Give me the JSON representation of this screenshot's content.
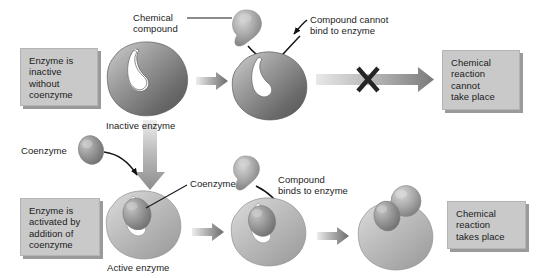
{
  "diagram": {
    "background": "#ffffff",
    "palette": {
      "enzyme_dark": "#6f6f6f",
      "enzyme_light": "#b8b8b8",
      "blob_gray": "#9a9a9a",
      "box_fill": "#c9c9c9",
      "box_shadow": "#9a9a9a",
      "text": "#1b1b1b",
      "arrow_dark": "#6c6c6c",
      "x_mark": "#2b2b2b"
    }
  },
  "top_row": {
    "left_box": {
      "lines": [
        "Enzyme is",
        "inactive",
        "without",
        "coenzyme"
      ]
    },
    "compound_label": {
      "lines": [
        "Chemical",
        "compound"
      ]
    },
    "enzyme_caption": "Inactive enzyme",
    "cannot_bind_label": {
      "lines": [
        "Compound cannot",
        "bind to enzyme"
      ]
    },
    "right_box": {
      "lines": [
        "Chemical",
        "reaction",
        "cannot",
        "take place"
      ]
    },
    "blocked_marker": "X"
  },
  "bottom_row": {
    "coenzyme_label": "Coenzyme",
    "left_box": {
      "lines": [
        "Enzyme is",
        "activated by",
        "addition of",
        "coenzyme"
      ]
    },
    "coenzyme_pointer_label": "Coenzyme",
    "enzyme_caption": "Active enzyme",
    "binds_label": {
      "lines": [
        "Compound",
        "binds to enzyme"
      ]
    },
    "right_box": {
      "lines": [
        "Chemical",
        "reaction",
        "takes place"
      ]
    }
  }
}
